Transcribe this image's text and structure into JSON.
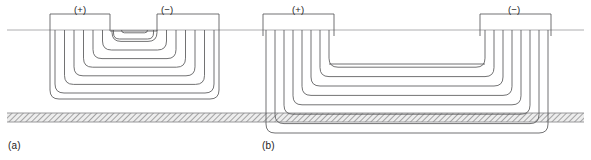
{
  "figure": {
    "type": "technical-cross-section-diagram",
    "background_color": "#ffffff",
    "line_color": "#58585a",
    "reference_line_color": "#9a9a9c",
    "hatch_color": "#8f8f91",
    "hatch_fill": "#e8e8e8",
    "text_color": "#1c1c1c"
  },
  "reference_line": {
    "label": "surface-reference-line",
    "y": 30,
    "x_start": 7,
    "x_end": 584
  },
  "substrate": {
    "label": "hatched-substrate-band",
    "y_top": 113,
    "y_bottom": 122,
    "x_start": 7,
    "x_end": 584
  },
  "panels": [
    {
      "id": "a",
      "caption": "(a)",
      "caption_x": 8,
      "caption_y": 140,
      "terminals": [
        {
          "name": "positive",
          "label": "(+)",
          "label_x": 74,
          "label_y": 4,
          "lead_x": 110
        },
        {
          "name": "negative",
          "label": "(−)",
          "label_x": 161,
          "label_y": 4,
          "lead_x": 157
        }
      ],
      "coil": {
        "turns": 8,
        "outer_left": 50,
        "outer_right": 219,
        "outer_top": 14,
        "outer_bottom": 99,
        "notch_left": 110,
        "notch_right": 157,
        "notch_depth": 17,
        "step_x": 9.5,
        "step_y": 8.6,
        "corner_radius": 9,
        "feed_direction": "center-fed"
      }
    },
    {
      "id": "b",
      "caption": "(b)",
      "caption_x": 262,
      "caption_y": 140,
      "terminals": [
        {
          "name": "positive",
          "label": "(+)",
          "label_x": 292,
          "label_y": 4,
          "lead_x": 266
        },
        {
          "name": "negative",
          "label": "(−)",
          "label_x": 508,
          "label_y": 4,
          "lead_x": 548
        },
        {
          "name": "positive-inner-wall",
          "label": "",
          "label_x": 0,
          "label_y": 0,
          "lead_x": 334
        },
        {
          "name": "negative-inner-wall",
          "label": "",
          "label_x": 0,
          "label_y": 0,
          "lead_x": 480
        }
      ],
      "coil": {
        "turns": 8,
        "outer_left": 263,
        "outer_right": 551,
        "outer_top": 14,
        "outer_bottom": 133,
        "gap_left": 334,
        "gap_right": 480,
        "step_x": 9.0,
        "step_y": 9.4,
        "corner_radius": 9,
        "feed_direction": "edge-fed"
      }
    }
  ]
}
